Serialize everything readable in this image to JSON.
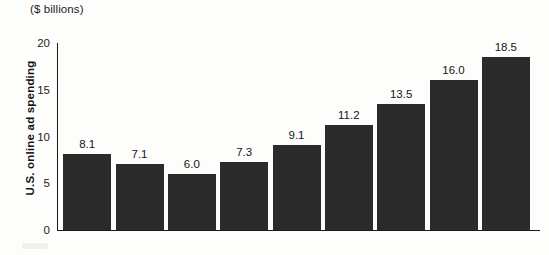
{
  "chart_data": {
    "type": "bar",
    "title": "",
    "unit_caption": "($ billions)",
    "xlabel": "",
    "ylabel": "U.S. online ad spending",
    "categories": [
      "2000",
      "2001",
      "2002",
      "2003",
      "2004",
      "2005",
      "2006",
      "2007",
      "2008"
    ],
    "values": [
      8.1,
      7.1,
      6.0,
      7.3,
      9.1,
      11.2,
      13.5,
      16.0,
      18.5
    ],
    "value_labels": [
      "8.1",
      "7.1",
      "6.0",
      "7.3",
      "9.1",
      "11.2",
      "13.5",
      "16.0",
      "18.5"
    ],
    "ylim": [
      0,
      20
    ],
    "yticks": [
      0,
      5,
      10,
      15,
      20
    ],
    "ytick_labels": [
      "0",
      "5",
      "10",
      "15",
      "20"
    ],
    "grid": false,
    "legend": false,
    "bar_color": "#2b2b2b",
    "axis_color": "#1a1a1a",
    "background_color": "#fdfdfc"
  }
}
